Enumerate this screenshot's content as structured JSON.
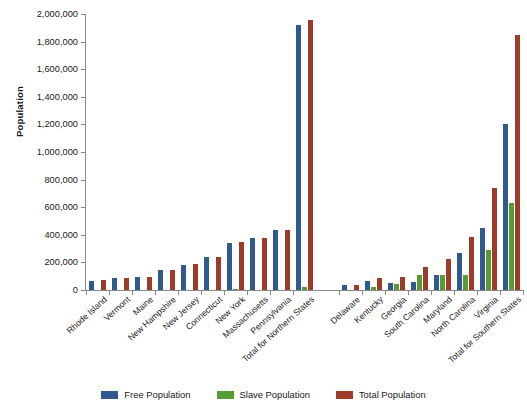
{
  "chart_data": {
    "type": "bar",
    "title": "",
    "xlabel": "",
    "ylabel": "Population",
    "ylim": [
      0,
      2000000
    ],
    "ytick_step": 200000,
    "grid": false,
    "legend_position": "bottom",
    "ytick_labels": [
      "0",
      "200,000",
      "400,000",
      "600,000",
      "800,000",
      "1,000,000",
      "1,200,000",
      "1,400,000",
      "1,600,000",
      "1,800,000",
      "2,000,000"
    ],
    "categories": [
      "Rhode Island",
      "Vermont",
      "Maine",
      "New Hampshire",
      "New Jersey",
      "Connecticut",
      "New York",
      "Massachusetts",
      "Pennsylvania",
      "Total for Northern States",
      "Delaware",
      "Kentucky",
      "Georgia",
      "South Carolina",
      "Maryland",
      "North Carolina",
      "Virginia",
      "Total for Southern States"
    ],
    "series": [
      {
        "name": "Free Population",
        "color": "#2e5b8c",
        "values": [
          68000,
          85000,
          96000,
          142000,
          184000,
          237000,
          340000,
          379000,
          434000,
          1920000,
          37000,
          62000,
          53000,
          59000,
          112000,
          270000,
          447000,
          1200000
        ]
      },
      {
        "name": "Slave Population",
        "color": "#569b34",
        "values": [
          0,
          0,
          0,
          0,
          0,
          0,
          4000,
          0,
          0,
          22000,
          2000,
          24000,
          42000,
          106000,
          112000,
          111000,
          290000,
          630000
        ]
      },
      {
        "name": "Total Population",
        "color": "#9e3a28",
        "values": [
          73000,
          85000,
          96000,
          142000,
          189000,
          241000,
          345000,
          380000,
          434000,
          1955000,
          39000,
          86000,
          95000,
          165000,
          224000,
          381000,
          737000,
          1850000
        ]
      }
    ],
    "group_gap_after_index": 9
  },
  "legend": {
    "items": [
      {
        "label": "Free Population",
        "color": "#2e5b8c",
        "swatch": "legend-swatch-free"
      },
      {
        "label": "Slave Population",
        "color": "#569b34",
        "swatch": "legend-swatch-slave"
      },
      {
        "label": "Total Population",
        "color": "#9e3a28",
        "swatch": "legend-swatch-total"
      }
    ]
  }
}
